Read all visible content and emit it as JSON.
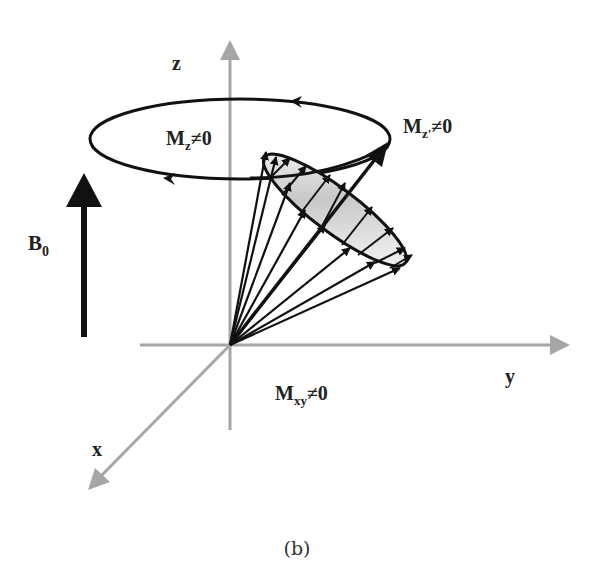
{
  "figure": {
    "caption": "(b)",
    "axes": {
      "x": "x",
      "y": "y",
      "z": "z"
    },
    "field": {
      "symbol": "B",
      "subscript": "0"
    },
    "labels": {
      "mz": {
        "main": "M",
        "sub": "z",
        "rest": "≠0"
      },
      "mz_prime": {
        "main": "M",
        "sub": "z'",
        "rest": "≠0"
      },
      "mxy": {
        "main": "M",
        "sub": "xy",
        "rest": "≠0"
      }
    },
    "colors": {
      "axis": "#a6a6a6",
      "ink": "#111111",
      "shade_light": "#f4f4f4",
      "shade_dark": "#b8b8b8"
    }
  }
}
